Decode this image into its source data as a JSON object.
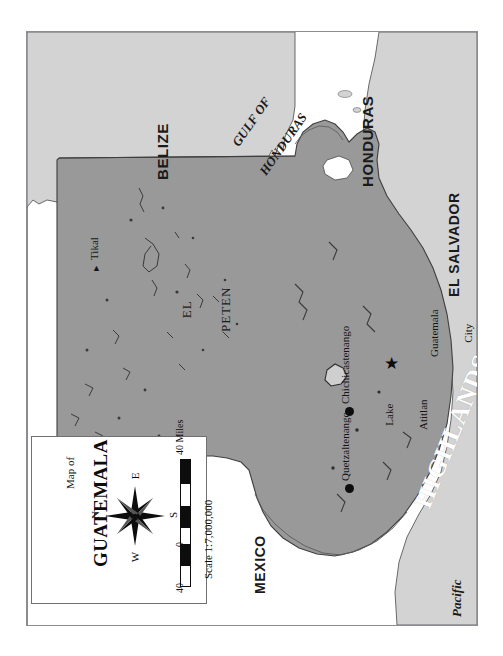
{
  "figure": {
    "kind": "reference-map",
    "subject": "Guatemala",
    "orientation_note": "page rotated 90 degrees clockwise; all text reads bottom-to-top",
    "colors": {
      "guatemala_fill": "#999999",
      "neighbor_fill": "#d3d3d3",
      "water_fill": "#ffffff",
      "outline": "#4a4a4a",
      "frame": "#8d8d93",
      "label_dark": "#1a1a1a",
      "highlands_label": "#ffffff"
    }
  },
  "countries": [
    {
      "id": "belize",
      "label": "BELIZE"
    },
    {
      "id": "honduras",
      "label": "HONDURAS"
    },
    {
      "id": "el-salvador",
      "label": "EL SALVADOR"
    },
    {
      "id": "mexico",
      "label": "MEXICO"
    }
  ],
  "water_bodies": [
    {
      "id": "gulf-of-honduras",
      "line1": "GULF OF",
      "line2": "HONDURAS"
    },
    {
      "id": "pacific-ocean",
      "line1": "Pacific",
      "line2": "Ocean"
    }
  ],
  "regions": [
    {
      "id": "el-peten",
      "line1": "EL",
      "line2": "PETEN"
    },
    {
      "id": "highlands",
      "label": "HIGHLANDS"
    }
  ],
  "places": [
    {
      "id": "tikal",
      "label": "Tikal",
      "marker": "triangle"
    },
    {
      "id": "guatemala-city",
      "line1": "Guatemala",
      "line2": "City",
      "marker": "star"
    },
    {
      "id": "chichicastenango",
      "label": "Chichicastenango",
      "marker": "dot"
    },
    {
      "id": "quetzaltenango",
      "label": "Quetzaltenango",
      "marker": "dot"
    },
    {
      "id": "lake-atitlan",
      "line1": "Lake",
      "line2": "Atitlan",
      "marker": "lake"
    }
  ],
  "inset": {
    "title_small": "Map of",
    "title_big": "GUATEMALA",
    "compass": {
      "north": "N",
      "east": "E",
      "south": "S",
      "west": "W"
    },
    "scale": {
      "left_number": "40",
      "middle_number": "0",
      "right_number": "40 Miles",
      "ratio": "Scale 1:7,000,000"
    }
  }
}
